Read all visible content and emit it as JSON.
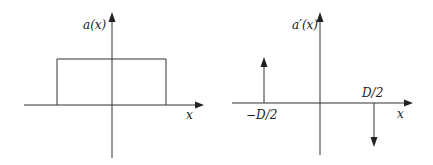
{
  "figure": {
    "left_panel": {
      "ylabel": "a(x)",
      "xlabel": "x",
      "shape": "rectangular pulse",
      "pulse": {
        "x_start": "-D/2",
        "x_end": "D/2",
        "height": 1
      }
    },
    "right_panel": {
      "ylabel": "a′(x)",
      "xlabel": "x",
      "shape": "impulses",
      "impulses": [
        {
          "position_label": "−D/2",
          "direction": "up"
        },
        {
          "position_label": "D/2",
          "direction": "down"
        }
      ]
    }
  },
  "colors": {
    "stroke": "#333333",
    "background": "#ffffff"
  }
}
